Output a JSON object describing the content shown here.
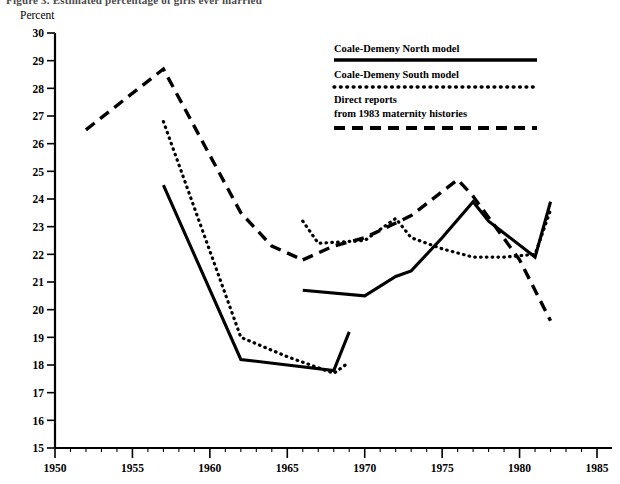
{
  "figure": {
    "title": "Figure 3. Estimated percentage of girls ever married",
    "y_axis_title": "Percent"
  },
  "legend": {
    "items": [
      {
        "label": "Coale-Demeny North model",
        "style": "solid"
      },
      {
        "label": "Coale-Demeny South model",
        "style": "dotted"
      },
      {
        "label_line1": "Direct reports",
        "label_line2": "from 1983 maternity histories",
        "style": "dashed"
      }
    ]
  },
  "axes": {
    "y_ticks": [
      "30",
      "29",
      "28",
      "27",
      "26",
      "25",
      "24",
      "23",
      "22",
      "21",
      "20",
      "19",
      "18",
      "17",
      "16",
      "15"
    ],
    "x_ticks": [
      "1950",
      "1955",
      "1960",
      "1965",
      "1970",
      "1975",
      "1980",
      "1985"
    ],
    "x_min": 1950,
    "x_max": 1985,
    "y_min": 15,
    "y_max": 30
  },
  "chart_data": {
    "type": "line",
    "title": "Figure 3. Estimated percentage of girls ever married",
    "xlabel": "",
    "ylabel": "Percent",
    "xlim": [
      1950,
      1985
    ],
    "ylim": [
      15,
      30
    ],
    "grid": false,
    "legend_position": "top-right",
    "series": [
      {
        "name": "Coale-Demeny North model",
        "style": "solid",
        "segments": [
          {
            "x": [
              1957,
              1962,
              1965,
              1968,
              1969
            ],
            "y": [
              24.5,
              18.2,
              18.0,
              17.8,
              19.2
            ]
          },
          {
            "x": [
              1966,
              1970,
              1972,
              1973,
              1975,
              1977,
              1978,
              1981,
              1982
            ],
            "y": [
              20.7,
              20.5,
              21.2,
              21.4,
              22.6,
              23.9,
              23.2,
              21.9,
              23.9
            ]
          }
        ]
      },
      {
        "name": "Coale-Demeny South model",
        "style": "dotted",
        "segments": [
          {
            "x": [
              1957,
              1962,
              1965,
              1968,
              1969
            ],
            "y": [
              26.8,
              19.0,
              18.3,
              17.7,
              18.1
            ]
          },
          {
            "x": [
              1966,
              1967,
              1970,
              1972,
              1973,
              1975,
              1977,
              1979,
              1981,
              1982
            ],
            "y": [
              23.2,
              22.4,
              22.5,
              23.3,
              22.6,
              22.2,
              21.9,
              21.9,
              22.0,
              23.6
            ]
          }
        ]
      },
      {
        "name": "Direct reports from 1983 maternity histories",
        "style": "dashed",
        "segments": [
          {
            "x": [
              1952,
              1957,
              1962,
              1964,
              1966
            ],
            "y": [
              26.5,
              28.7,
              23.5,
              22.3,
              21.8
            ]
          },
          {
            "x": [
              1966,
              1968,
              1970,
              1973,
              1976,
              1977,
              1980,
              1982
            ],
            "y": [
              21.8,
              22.3,
              22.6,
              23.4,
              24.7,
              24.1,
              21.8,
              19.6
            ]
          }
        ]
      }
    ]
  }
}
